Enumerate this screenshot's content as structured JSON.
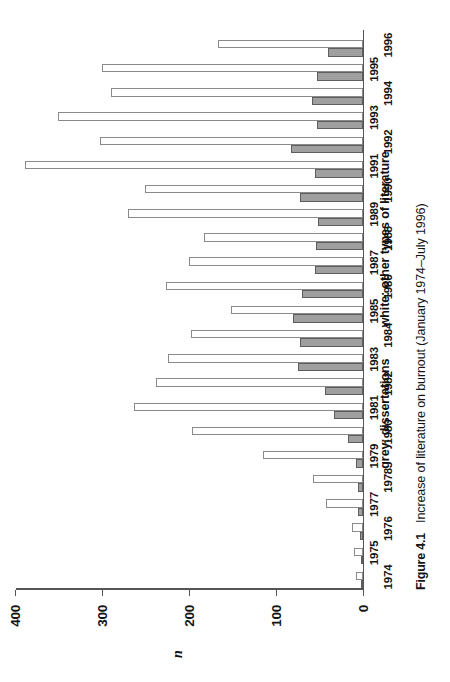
{
  "figure": {
    "caption_number": "Figure 4.1",
    "caption_text": "Increase of literature on burnout (January 1974–July 1996)",
    "legend": {
      "grey": "grey: dissertations",
      "white": "white: other types of literature"
    },
    "axis": {
      "y_title": "n",
      "y_ticks": [
        "0",
        "100",
        "200",
        "300",
        "400"
      ]
    }
  },
  "chart_data": {
    "type": "bar",
    "title": "Increase of literature on burnout (January 1974–July 1996)",
    "xlabel": "",
    "ylabel": "n",
    "ylim": [
      0,
      400
    ],
    "grid": false,
    "legend_position": "below",
    "categories": [
      "1974",
      "1975",
      "1976",
      "1977",
      "1978",
      "1979",
      "1980",
      "1981",
      "1982",
      "1983",
      "1984",
      "1985",
      "1986",
      "1987",
      "1988",
      "1989",
      "1990",
      "1991",
      "1992",
      "1993",
      "1994",
      "1995",
      "1996"
    ],
    "series": [
      {
        "name": "grey: dissertations",
        "color": "#9f9f9f",
        "values": [
          1,
          1,
          3,
          5,
          6,
          8,
          17,
          33,
          43,
          75,
          72,
          80,
          70,
          55,
          54,
          52,
          72,
          55,
          82,
          53,
          58,
          53,
          40
        ]
      },
      {
        "name": "white: other types of literature",
        "color": "#fefefe",
        "values": [
          8,
          10,
          12,
          42,
          57,
          115,
          196,
          263,
          238,
          224,
          198,
          152,
          226,
          200,
          182,
          270,
          250,
          388,
          302,
          350,
          289,
          300,
          167
        ]
      }
    ]
  }
}
